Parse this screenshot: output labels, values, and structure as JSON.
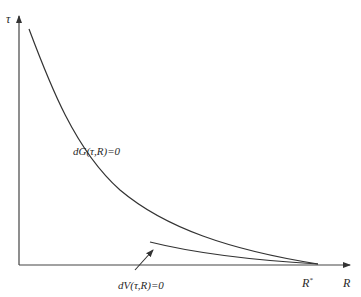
{
  "diagram": {
    "y_axis": {
      "label": "τ"
    },
    "x_axis": {
      "label": "R",
      "marker_label": "R",
      "marker_superscript": "*"
    },
    "curves": [
      {
        "name": "dG",
        "label": "dG(τ,R)=0"
      },
      {
        "name": "dV",
        "label": "dV(τ,R)=0"
      }
    ],
    "colors": {
      "line": "#333333",
      "background": "#ffffff"
    }
  }
}
